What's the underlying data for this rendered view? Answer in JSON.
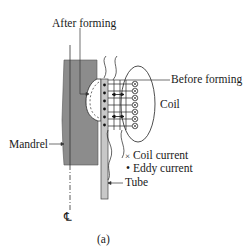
{
  "figure": {
    "caption": "(a)",
    "centerline_symbol": "℄",
    "labels": {
      "after_forming": "After forming",
      "before_forming": "Before forming",
      "coil": "Coil",
      "mandrel": "Mandrel",
      "tube": "Tube"
    },
    "legend": [
      {
        "symbol": "×",
        "text": "Coil current"
      },
      {
        "symbol": "•",
        "text": "Eddy current"
      }
    ],
    "colors": {
      "mandrel_fill": "#8c8c8c",
      "tube_fill": "#c8c8c8",
      "line": "#1a1a1a"
    }
  }
}
